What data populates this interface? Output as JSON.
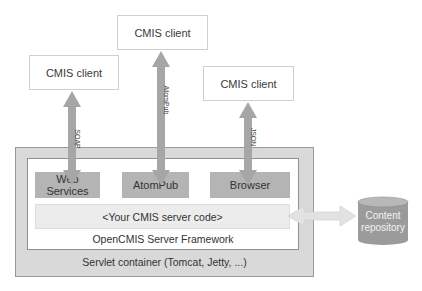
{
  "diagram": {
    "clients": [
      {
        "label": "CMIS client",
        "binding": "SOAP"
      },
      {
        "label": "CMIS client",
        "binding": "AtomPub"
      },
      {
        "label": "CMIS client",
        "binding": "JSON"
      }
    ],
    "bindings": [
      {
        "label": "Web Services"
      },
      {
        "label": "AtomPub"
      },
      {
        "label": "Browser"
      }
    ],
    "server_code": "<Your CMIS server code>",
    "framework_label": "OpenCMIS Server Framework",
    "container_label": "Servlet container (Tomcat, Jetty, ...)",
    "repository": {
      "line1": "Content",
      "line2": "repository"
    },
    "colors": {
      "arrow": "#a6a6a6",
      "binding_box": "#b4b4b4",
      "container": "#d9d9d9",
      "repository": "#9a9a9a",
      "repo_arrow": "#e0e0e0"
    }
  }
}
